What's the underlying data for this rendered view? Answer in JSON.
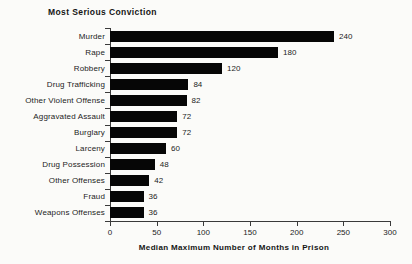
{
  "chart_data": {
    "type": "bar",
    "orientation": "horizontal",
    "title": "Most Serious Conviction",
    "xlabel": "Median Maximum Number of Months in Prison",
    "categories": [
      "Murder",
      "Rape",
      "Robbery",
      "Drug Trafficking",
      "Other Violent Offense",
      "Aggravated Assault",
      "Burglary",
      "Larceny",
      "Drug Possession",
      "Other Offenses",
      "Fraud",
      "Weapons Offenses"
    ],
    "values": [
      240,
      180,
      120,
      84,
      82,
      72,
      72,
      60,
      48,
      42,
      36,
      36
    ],
    "value_labels": [
      "240",
      "180",
      "120",
      "84",
      "82",
      "72",
      "72",
      "60",
      "48",
      "42",
      "36",
      "36"
    ],
    "xlim": [
      0,
      300
    ],
    "xticks": [
      0,
      50,
      100,
      150,
      200,
      250,
      300
    ],
    "grid": false,
    "legend": "none",
    "bar_color": "#060606",
    "background_color": "#fbfbf9",
    "text_color": "#1c1c1c"
  }
}
